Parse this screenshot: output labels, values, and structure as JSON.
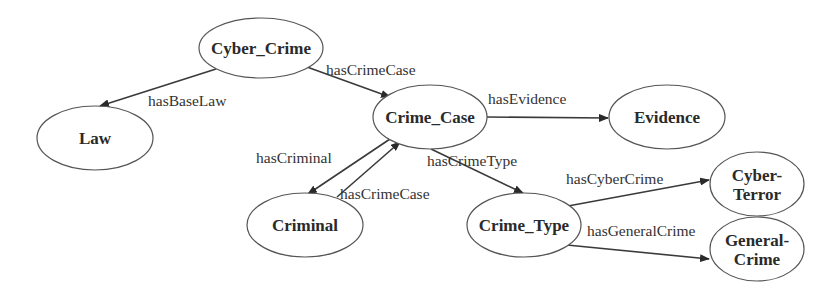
{
  "diagram": {
    "title": "",
    "nodes": [
      {
        "id": "cyber_crime",
        "lines": [
          "Cyber_Crime"
        ],
        "cx": 261,
        "cy": 48,
        "rx": 62,
        "ry": 30
      },
      {
        "id": "law",
        "lines": [
          "Law"
        ],
        "cx": 95,
        "cy": 138,
        "rx": 58,
        "ry": 32
      },
      {
        "id": "crime_case",
        "lines": [
          "Crime_Case"
        ],
        "cx": 430,
        "cy": 117,
        "rx": 57,
        "ry": 32
      },
      {
        "id": "evidence",
        "lines": [
          "Evidence"
        ],
        "cx": 667,
        "cy": 117,
        "rx": 58,
        "ry": 32
      },
      {
        "id": "criminal",
        "lines": [
          "Criminal"
        ],
        "cx": 305,
        "cy": 225,
        "rx": 58,
        "ry": 32
      },
      {
        "id": "crime_type",
        "lines": [
          "Crime_Type"
        ],
        "cx": 524,
        "cy": 225,
        "rx": 57,
        "ry": 32
      },
      {
        "id": "cyber_terror",
        "lines": [
          "Cyber-",
          "Terror"
        ],
        "cx": 757,
        "cy": 184,
        "rx": 47,
        "ry": 32
      },
      {
        "id": "general_crime",
        "lines": [
          "General-",
          "Crime"
        ],
        "cx": 757,
        "cy": 249,
        "rx": 47,
        "ry": 32
      }
    ],
    "edges": [
      {
        "from": "cyber_crime",
        "to": "law",
        "label": "hasBaseLaw",
        "x1": 216,
        "y1": 69,
        "x2": 100,
        "y2": 106,
        "lx": 148,
        "ly": 106
      },
      {
        "from": "cyber_crime",
        "to": "crime_case",
        "label": "hasCrimeCase",
        "x1": 307,
        "y1": 67,
        "x2": 390,
        "y2": 97,
        "lx": 326,
        "ly": 75
      },
      {
        "from": "crime_case",
        "to": "evidence",
        "label": "hasEvidence",
        "x1": 487,
        "y1": 117,
        "x2": 608,
        "y2": 118,
        "lx": 488,
        "ly": 104
      },
      {
        "from": "crime_case",
        "to": "criminal",
        "label": "hasCriminal",
        "x1": 390,
        "y1": 139,
        "x2": 308,
        "y2": 194,
        "lx": 256,
        "ly": 163
      },
      {
        "from": "criminal",
        "to": "crime_case",
        "label": "hasCrimeCase",
        "x1": 337,
        "y1": 197,
        "x2": 400,
        "y2": 142,
        "lx": 340,
        "ly": 199
      },
      {
        "from": "crime_case",
        "to": "crime_type",
        "label": "hasCrimeType",
        "x1": 431,
        "y1": 149,
        "x2": 523,
        "y2": 193,
        "lx": 427,
        "ly": 166
      },
      {
        "from": "crime_type",
        "to": "cyber_terror",
        "label": "hasCyberCrime",
        "x1": 568,
        "y1": 206,
        "x2": 709,
        "y2": 180,
        "lx": 566,
        "ly": 184
      },
      {
        "from": "crime_type",
        "to": "general_crime",
        "label": "hasGeneralCrime",
        "x1": 567,
        "y1": 245,
        "x2": 709,
        "y2": 259,
        "lx": 587,
        "ly": 236
      }
    ]
  },
  "colors": {
    "stroke": "#555555",
    "edge": "#3a3a3a",
    "text": "#2a2a2a",
    "background": "#ffffff"
  }
}
